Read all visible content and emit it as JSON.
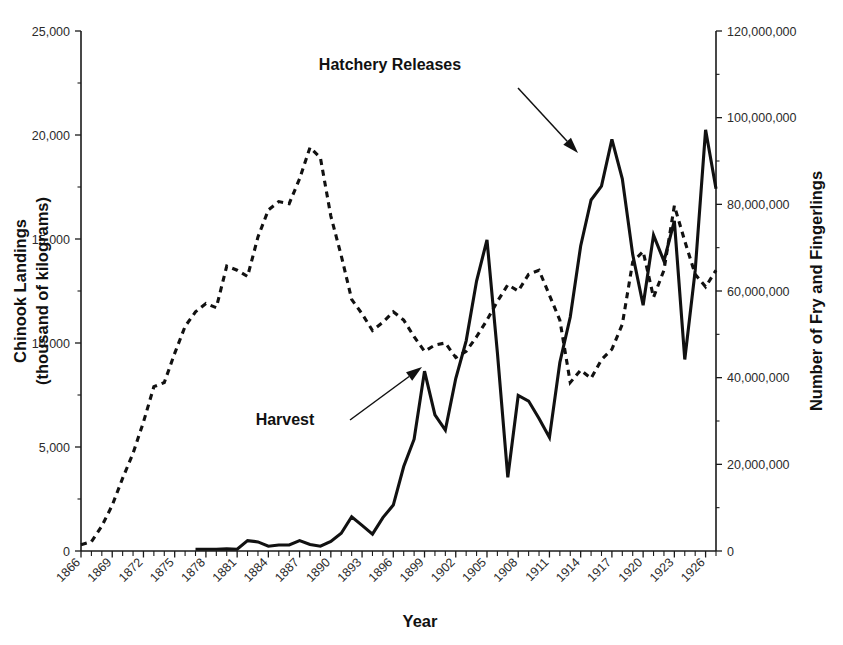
{
  "chart_data": {
    "type": "line",
    "title": "",
    "xlabel": "Year",
    "ylabel": "Chinook Landings\n(thousand of kilograms)",
    "ylabel_line1": "Chinook Landings",
    "ylabel_line2": "(thousand of kilograms)",
    "y2label": "Number of Fry and Fingerlings",
    "xlim": [
      1866,
      1927
    ],
    "ylim": [
      0,
      25000
    ],
    "y2lim": [
      0,
      120000000
    ],
    "grid": false,
    "legend": "none (inline annotations with arrows)",
    "xticklabels": [
      "1866",
      "1869",
      "1872",
      "1875",
      "1878",
      "1881",
      "1884",
      "1887",
      "1890",
      "1893",
      "1896",
      "1899",
      "1902",
      "1905",
      "1908",
      "1911",
      "1914",
      "1917",
      "1920",
      "1923",
      "1926"
    ],
    "xtick_step_years": 3,
    "xtick_minor_step_years": 1,
    "yticklabels": [
      "0",
      "5,000",
      "10,000",
      "15,000",
      "20,000",
      "25,000"
    ],
    "ytickvalues": [
      0,
      5000,
      10000,
      15000,
      20000,
      25000
    ],
    "y2ticklabels": [
      "0",
      "20,000,000",
      "40,000,000",
      "60,000,000",
      "80,000,000",
      "100,000,000",
      "120,000,000"
    ],
    "y2tickvalues": [
      0,
      20000000,
      40000000,
      60000000,
      80000000,
      100000000,
      120000000
    ],
    "annotations": [
      {
        "text": "Hatchery Releases",
        "text_x": 390,
        "text_y": 70,
        "arrow_from_x": 518,
        "arrow_from_y": 88,
        "arrow_to_x": 578,
        "arrow_to_y": 153
      },
      {
        "text": "Harvest",
        "text_x": 285,
        "text_y": 425,
        "arrow_from_x": 350,
        "arrow_from_y": 420,
        "arrow_to_x": 422,
        "arrow_to_y": 367
      }
    ],
    "series": [
      {
        "name": "Harvest",
        "axis": "left",
        "style": "dashed",
        "units": "thousand of kilograms",
        "x": [
          1866,
          1867,
          1868,
          1869,
          1870,
          1871,
          1872,
          1873,
          1874,
          1875,
          1876,
          1877,
          1878,
          1879,
          1880,
          1881,
          1882,
          1883,
          1884,
          1885,
          1886,
          1887,
          1888,
          1889,
          1890,
          1891,
          1892,
          1893,
          1894,
          1895,
          1896,
          1897,
          1898,
          1899,
          1900,
          1901,
          1902,
          1903,
          1904,
          1905,
          1906,
          1907,
          1908,
          1909,
          1910,
          1911,
          1912,
          1913,
          1914,
          1915,
          1916,
          1917,
          1918,
          1919,
          1920,
          1921,
          1922,
          1923,
          1924,
          1925,
          1926,
          1927
        ],
        "values": [
          300,
          450,
          1200,
          2200,
          3500,
          4700,
          6200,
          7900,
          8100,
          9500,
          10800,
          11500,
          11900,
          11700,
          13700,
          13500,
          13200,
          15100,
          16400,
          16800,
          16700,
          17900,
          19400,
          18900,
          16100,
          14200,
          12100,
          11400,
          10600,
          11000,
          11500,
          11100,
          10300,
          9600,
          9900,
          10000,
          9300,
          9600,
          10300,
          11100,
          12000,
          12800,
          12500,
          13300,
          13500,
          12300,
          11100,
          8100,
          8700,
          8300,
          9200,
          9700,
          10900,
          13900,
          14400,
          12200,
          13500,
          16600,
          14900,
          13300,
          12700,
          13500
        ]
      },
      {
        "name": "Hatchery Releases",
        "axis": "right",
        "style": "solid",
        "units": "number of fry and fingerlings",
        "x": [
          1877,
          1878,
          1879,
          1880,
          1881,
          1882,
          1883,
          1884,
          1885,
          1886,
          1887,
          1888,
          1889,
          1890,
          1891,
          1892,
          1893,
          1894,
          1895,
          1896,
          1897,
          1898,
          1899,
          1900,
          1901,
          1902,
          1903,
          1904,
          1905,
          1906,
          1907,
          1908,
          1909,
          1910,
          1911,
          1912,
          1913,
          1914,
          1915,
          1916,
          1917,
          1918,
          1919,
          1920,
          1921,
          1922,
          1923,
          1924,
          1925,
          1926,
          1927
        ],
        "values": [
          400000,
          400000,
          400000,
          500000,
          400000,
          2400000,
          2100000,
          1100000,
          1400000,
          1400000,
          2400000,
          1500000,
          1100000,
          2200000,
          4100000,
          7900000,
          5900000,
          3900000,
          7700000,
          10600000,
          19500000,
          25800000,
          41500000,
          31400000,
          27900000,
          39800000,
          48500000,
          62300000,
          71800000,
          45800000,
          17000000,
          35900000,
          34600000,
          30600000,
          26200000,
          43500000,
          54000000,
          70400000,
          81000000,
          84200000,
          95000000,
          85900000,
          68400000,
          56700000,
          72900000,
          66900000,
          76200000,
          44200000,
          64700000,
          97200000,
          83600000
        ]
      }
    ],
    "harvest_peak": {
      "year": 1888,
      "value": 19400
    },
    "hatchery_peak": {
      "year": 1926,
      "value": 97200000
    }
  },
  "axes": {
    "left_title_line1": "Chinook Landings",
    "left_title_line2": "(thousand of kilograms)",
    "right_title": "Number of Fry and Fingerlings",
    "bottom_title": "Year"
  }
}
